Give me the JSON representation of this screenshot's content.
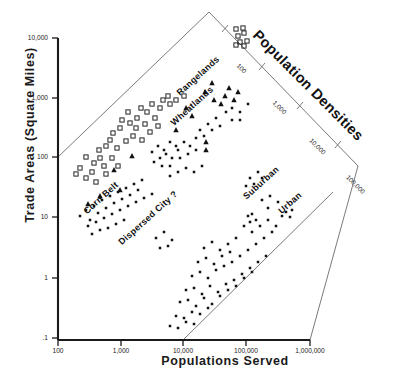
{
  "chart_data": {
    "type": "scatter",
    "title": "",
    "xlabel": "Populations Served",
    "ylabel": "Trade Areas (Square Miles)",
    "xscale": "log",
    "yscale": "log",
    "xlim": [
      100,
      1000000
    ],
    "ylim": [
      0.1,
      10000
    ],
    "xticks": [
      "100",
      "1,000",
      "10,000",
      "100,000",
      "1,000,000"
    ],
    "yticks": [
      "10,000",
      "1,000",
      "100",
      "10",
      "1",
      ".1"
    ],
    "grid": false,
    "legend_position": "none",
    "diagonal_axis": {
      "title": "Population Densities",
      "ticks": [
        "100",
        "1,000",
        "10,000",
        "100,000"
      ],
      "description": "Density = Population / Trade Area, drawn as a rotated axis across the upper-right of the plot"
    },
    "annotations": [
      {
        "label": "Rangelands",
        "x": 200,
        "y": 78,
        "rotation": -42
      },
      {
        "label": "Wheatlands",
        "x": 194,
        "y": 108,
        "rotation": -42
      },
      {
        "label": "Corn Belt",
        "x": 103,
        "y": 200,
        "rotation": -42
      },
      {
        "label": "Dispersed City ?",
        "x": 150,
        "y": 220,
        "rotation": -42
      },
      {
        "label": "Suburban",
        "x": 263,
        "y": 185,
        "rotation": -42
      },
      {
        "label": "Urban",
        "x": 292,
        "y": 205,
        "rotation": -42
      }
    ],
    "series": [
      {
        "name": "Open square markers",
        "marker": "open-square",
        "points": [
          [
            86,
            157
          ],
          [
            94,
            163
          ],
          [
            80,
            168
          ],
          [
            99,
            150
          ],
          [
            106,
            146
          ],
          [
            92,
            172
          ],
          [
            86,
            178
          ],
          [
            76,
            174
          ],
          [
            100,
            158
          ],
          [
            110,
            140
          ],
          [
            113,
            133
          ],
          [
            120,
            128
          ],
          [
            104,
            166
          ],
          [
            122,
            120
          ],
          [
            130,
            123
          ],
          [
            128,
            112
          ],
          [
            137,
            118
          ],
          [
            141,
            108
          ],
          [
            147,
            112
          ],
          [
            152,
            104
          ],
          [
            160,
            108
          ],
          [
            136,
            128
          ],
          [
            145,
            124
          ],
          [
            117,
            148
          ],
          [
            126,
            141
          ],
          [
            133,
            136
          ],
          [
            155,
            118
          ],
          [
            163,
            100
          ],
          [
            170,
            104
          ],
          [
            112,
            158
          ],
          [
            96,
            182
          ],
          [
            106,
            174
          ],
          [
            118,
            166
          ],
          [
            168,
            96
          ],
          [
            176,
            100
          ],
          [
            184,
            96
          ],
          [
            150,
            132
          ],
          [
            142,
            140
          ],
          [
            158,
            126
          ],
          [
            238,
            36
          ],
          [
            244,
            33
          ],
          [
            240,
            42
          ],
          [
            247,
            41
          ],
          [
            236,
            45
          ],
          [
            244,
            46
          ],
          [
            236,
            29
          ],
          [
            243,
            28
          ]
        ]
      },
      {
        "name": "Filled triangle markers",
        "marker": "filled-triangle",
        "points": [
          [
            88,
            204
          ],
          [
            114,
            170
          ],
          [
            132,
            156
          ],
          [
            186,
            108
          ],
          [
            205,
            92
          ],
          [
            214,
            100
          ],
          [
            212,
            83
          ],
          [
            225,
            96
          ],
          [
            229,
            88
          ],
          [
            234,
            100
          ],
          [
            221,
            104
          ],
          [
            206,
            142
          ],
          [
            206,
            150
          ],
          [
            176,
            130
          ],
          [
            192,
            116
          ],
          [
            238,
            92
          ],
          [
            120,
            190
          ],
          [
            100,
            196
          ]
        ]
      },
      {
        "name": "Small dot markers",
        "marker": "dot",
        "points": [
          [
            80,
            216
          ],
          [
            86,
            210
          ],
          [
            90,
            220
          ],
          [
            94,
            206
          ],
          [
            98,
            213
          ],
          [
            102,
            200
          ],
          [
            106,
            208
          ],
          [
            110,
            196
          ],
          [
            114,
            203
          ],
          [
            118,
            192
          ],
          [
            122,
            199
          ],
          [
            126,
            188
          ],
          [
            130,
            195
          ],
          [
            134,
            184
          ],
          [
            138,
            190
          ],
          [
            142,
            180
          ],
          [
            88,
            226
          ],
          [
            96,
            222
          ],
          [
            104,
            218
          ],
          [
            112,
            214
          ],
          [
            120,
            210
          ],
          [
            128,
            206
          ],
          [
            136,
            202
          ],
          [
            144,
            198
          ],
          [
            152,
            194
          ],
          [
            92,
            234
          ],
          [
            100,
            230
          ],
          [
            108,
            228
          ],
          [
            116,
            224
          ],
          [
            124,
            220
          ],
          [
            152,
            152
          ],
          [
            158,
            146
          ],
          [
            164,
            150
          ],
          [
            170,
            142
          ],
          [
            176,
            146
          ],
          [
            160,
            158
          ],
          [
            166,
            154
          ],
          [
            172,
            158
          ],
          [
            178,
            150
          ],
          [
            184,
            142
          ],
          [
            190,
            146
          ],
          [
            196,
            138
          ],
          [
            154,
            162
          ],
          [
            162,
            166
          ],
          [
            170,
            166
          ],
          [
            180,
            158
          ],
          [
            188,
            154
          ],
          [
            196,
            150
          ],
          [
            200,
            130
          ],
          [
            208,
            124
          ],
          [
            216,
            118
          ],
          [
            204,
            136
          ],
          [
            212,
            130
          ],
          [
            220,
            126
          ],
          [
            226,
            112
          ],
          [
            232,
            108
          ],
          [
            240,
            112
          ],
          [
            248,
            104
          ],
          [
            232,
            120
          ],
          [
            240,
            120
          ],
          [
            170,
            176
          ],
          [
            178,
            172
          ],
          [
            186,
            168
          ],
          [
            194,
            172
          ],
          [
            202,
            166
          ],
          [
            250,
            178
          ],
          [
            258,
            172
          ],
          [
            246,
            186
          ],
          [
            254,
            184
          ],
          [
            262,
            178
          ],
          [
            286,
            212
          ],
          [
            292,
            210
          ],
          [
            282,
            216
          ],
          [
            290,
            217
          ],
          [
            248,
            216
          ],
          [
            252,
            214
          ],
          [
            250,
            222
          ],
          [
            256,
            220
          ],
          [
            204,
            248
          ],
          [
            212,
            242
          ],
          [
            220,
            250
          ],
          [
            228,
            244
          ],
          [
            236,
            238
          ],
          [
            198,
            262
          ],
          [
            206,
            258
          ],
          [
            214,
            264
          ],
          [
            222,
            256
          ],
          [
            230,
            252
          ],
          [
            192,
            276
          ],
          [
            200,
            272
          ],
          [
            208,
            278
          ],
          [
            216,
            270
          ],
          [
            224,
            266
          ],
          [
            232,
            262
          ],
          [
            240,
            256
          ],
          [
            248,
            250
          ],
          [
            256,
            244
          ],
          [
            264,
            238
          ],
          [
            272,
            232
          ],
          [
            186,
            290
          ],
          [
            194,
            288
          ],
          [
            202,
            294
          ],
          [
            210,
            286
          ],
          [
            218,
            292
          ],
          [
            226,
            284
          ],
          [
            234,
            280
          ],
          [
            242,
            274
          ],
          [
            250,
            268
          ],
          [
            258,
            262
          ],
          [
            266,
            256
          ],
          [
            180,
            302
          ],
          [
            188,
            300
          ],
          [
            196,
            306
          ],
          [
            204,
            298
          ],
          [
            212,
            304
          ],
          [
            220,
            296
          ],
          [
            228,
            290
          ],
          [
            236,
            286
          ],
          [
            244,
            278
          ],
          [
            252,
            272
          ],
          [
            176,
            316
          ],
          [
            184,
            318
          ],
          [
            192,
            312
          ],
          [
            200,
            314
          ],
          [
            208,
            308
          ],
          [
            170,
            326
          ],
          [
            178,
            328
          ],
          [
            186,
            322
          ],
          [
            194,
            324
          ],
          [
            244,
            226
          ],
          [
            252,
            232
          ],
          [
            260,
            226
          ],
          [
            268,
            220
          ],
          [
            276,
            226
          ],
          [
            262,
            200
          ],
          [
            270,
            196
          ],
          [
            278,
            202
          ],
          [
            268,
            208
          ],
          [
            156,
            238
          ],
          [
            164,
            232
          ],
          [
            172,
            240
          ],
          [
            160,
            248
          ],
          [
            168,
            246
          ]
        ]
      }
    ]
  },
  "axis_titles": {
    "y": "Trade Areas (Square Miles)",
    "x": "Populations Served"
  },
  "density_axis": {
    "title": "Population Densities",
    "tick_labels": [
      "100",
      "1,000",
      "10,000",
      "100,000"
    ]
  }
}
